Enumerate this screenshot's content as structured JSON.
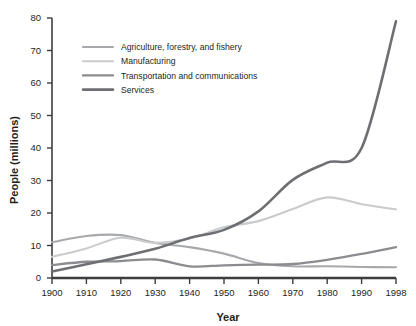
{
  "figure": {
    "caption_remnant": "",
    "background_color": "#ffffff",
    "width": 416,
    "height": 326
  },
  "axes": {
    "y_title": "People (millions)",
    "x_title": "Year",
    "y_ticks": [
      "0",
      "10",
      "20",
      "30",
      "40",
      "50",
      "60",
      "70",
      "80"
    ],
    "x_ticks": [
      "1900",
      "1910",
      "1920",
      "1930",
      "1940",
      "1950",
      "1960",
      "1970",
      "1980",
      "1990",
      "1998"
    ],
    "axis_color": "#3d3d40"
  },
  "legend": {
    "position": "inside-upper-left",
    "entries": [
      {
        "label": "Agriculture, forestry, and fishery",
        "color": "#a7a9ac",
        "width": 2.1
      },
      {
        "label": "Manufacturing",
        "color": "#c9cbcd",
        "width": 2.1
      },
      {
        "label": "Transportation and communications",
        "color": "#8a8c8f",
        "width": 2.3
      },
      {
        "label": "Services",
        "color": "#6d6f72",
        "width": 2.6
      }
    ]
  },
  "chart_data": {
    "type": "line",
    "title": "",
    "xlabel": "Year",
    "ylabel": "People (millions)",
    "xlim": [
      1900,
      1998
    ],
    "ylim": [
      0,
      80
    ],
    "ytick_step": 10,
    "grid": false,
    "legend_position": "inside upper left",
    "x": [
      1900,
      1910,
      1920,
      1930,
      1940,
      1950,
      1960,
      1970,
      1980,
      1990,
      1998
    ],
    "series": [
      {
        "name": "Agriculture, forestry, and fishery",
        "color": "#a7a9ac",
        "values": [
          11.0,
          12.9,
          13.2,
          10.8,
          9.5,
          7.5,
          4.6,
          3.6,
          3.6,
          3.4,
          3.3
        ]
      },
      {
        "name": "Manufacturing",
        "color": "#c9cbcd",
        "values": [
          6.5,
          9.1,
          12.4,
          10.8,
          12.2,
          15.6,
          17.5,
          21.2,
          24.8,
          22.7,
          21.1
        ]
      },
      {
        "name": "Transportation and communications",
        "color": "#8a8c8f",
        "values": [
          4.0,
          5.0,
          5.2,
          5.7,
          3.6,
          3.9,
          4.1,
          4.3,
          5.6,
          7.4,
          9.5
        ]
      },
      {
        "name": "Services",
        "color": "#6d6f72",
        "values": [
          2.0,
          4.2,
          6.5,
          9.0,
          12.3,
          14.8,
          20.5,
          30.2,
          35.5,
          40.0,
          79.0
        ]
      }
    ],
    "notes": [
      "Services crosses above Agriculture near 1933 and above Manufacturing near 1962.",
      "Agriculture peaks near 13.3 around 1916 then declines steadily.",
      "Manufacturing peaks near 24.8 around 1979 then declines.",
      "Transportation dips to about 3.9 near 1965 then rises to 9.5 by 1998.",
      "Services rises sharply after 1990 reaching about 79 at 1998."
    ]
  }
}
